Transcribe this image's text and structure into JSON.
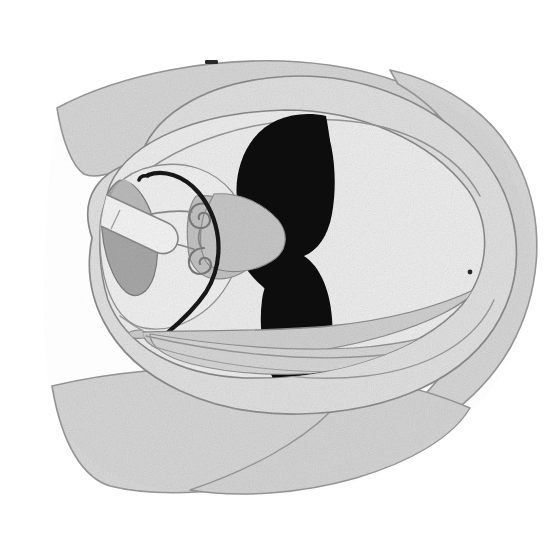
{
  "figure": {
    "domain": "Natural-Image",
    "kind": "anatomical-section-drawing",
    "background_color": "#ffffff",
    "canvas": {
      "width": 551,
      "height": 542
    },
    "text_labels": [],
    "scale_bar": null
  },
  "palette": {
    "background": "#ffffff",
    "outer_rim": "#d8d8d8",
    "outer_rim_stroke": "#9a9a9a",
    "mid_field": "#e2e2e2",
    "mid_field_stroke": "#8e8e8e",
    "inner_field": "#efefef",
    "inner_field_stroke": "#8a8a8a",
    "pale_field": "#f2f2f2",
    "wedge_gray": "#a9a9a9",
    "wedge_gray_stroke": "#7e7e7e",
    "mid_gray": "#c5c5c5",
    "light_gray": "#dcdcdc",
    "capsule_fill": "#f6f6f6",
    "capsule_stroke": "#8b8b8b",
    "black_structure": "#0d0d0d",
    "dark_line": "#1a1a1a",
    "band_fill": "#d2d2d2",
    "band_stroke": "#8f8f8f",
    "tick_mark": "#2a2a2a"
  },
  "structures": [
    {
      "id": "outer-rim-superior",
      "name": "superior outer rim lobe",
      "tone": "light gray",
      "fill": "#d8d8d8",
      "position": "upper left to upper right, crescent"
    },
    {
      "id": "outer-rim-inferior",
      "name": "inferior outer rim lobe",
      "tone": "light gray",
      "fill": "#d8d8d8",
      "position": "lower left to lower right, crescent"
    },
    {
      "id": "outer-rim-right",
      "name": "right lateral outer rim",
      "tone": "light gray",
      "fill": "#d8d8d8",
      "position": "right margin, broad arc"
    },
    {
      "id": "mid-field",
      "name": "intermediate tissue field",
      "tone": "pale gray",
      "fill": "#e2e2e2",
      "position": "enclosed by outer rim"
    },
    {
      "id": "inner-field",
      "name": "central pale field",
      "tone": "near white",
      "fill": "#efefef",
      "position": "center, large ovoid"
    },
    {
      "id": "black-figure-eight",
      "name": "dense black figure-eight structure",
      "tone": "black",
      "fill": "#0d0d0d",
      "position": "center, vertical hourglass with upper bulb, narrow isthmus, lower bulb and inferior tail"
    },
    {
      "id": "triangular-wedge-left",
      "name": "left shaded triangular wedge",
      "tone": "medium gray",
      "fill": "#a9a9a9",
      "position": "left of center, apex up"
    },
    {
      "id": "triangular-wedge-central",
      "name": "central gray wedge",
      "tone": "light-medium gray",
      "fill": "#c5c5c5",
      "position": "center-left, apex pointing left"
    },
    {
      "id": "rod-capsule",
      "name": "elongated rod-shaped capsule",
      "tone": "near white with outline",
      "fill": "#f6f6f6",
      "position": "left, oblique, rounded ends"
    },
    {
      "id": "spiral-coils",
      "name": "paired spiral coils",
      "tone": "outlined",
      "fill": "#e8e8e8",
      "position": "center-left, two small hooked spirals"
    },
    {
      "id": "dark-arc",
      "name": "thick dark curved fiber arc",
      "tone": "black",
      "fill": "#1a1a1a",
      "position": "arcs from upper left down through center to lower left"
    },
    {
      "id": "short-dark-line",
      "name": "short vertical dark line segment",
      "tone": "black",
      "fill": "#1a1a1a",
      "position": "left of center, vertical"
    },
    {
      "id": "tapering-bands",
      "name": "long tapering fibrous bands",
      "tone": "light gray",
      "fill": "#d2d2d2",
      "position": "lower half, sweeping left to right"
    },
    {
      "id": "tick-mark-superior",
      "name": "small dark tick mark at superior margin",
      "tone": "dark gray",
      "fill": "#2a2a2a",
      "position": "top edge near midline"
    },
    {
      "id": "dot-right-margin",
      "name": "small dark dot at right margin",
      "tone": "dark gray",
      "fill": "#2a2a2a",
      "position": "right lateral boundary"
    }
  ]
}
